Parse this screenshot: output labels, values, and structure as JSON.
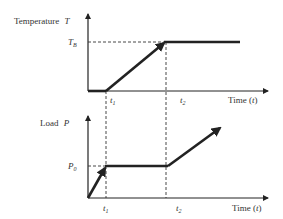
{
  "top_chart": {
    "y_label": "Temperature",
    "y_symbol": "T",
    "level_label": "T",
    "level_sub": "B",
    "t1_label": "t",
    "t1_sub": "1",
    "t2_label": "t",
    "t2_sub": "2",
    "x_label": "Time (",
    "x_symbol": "t",
    "x_close": ")"
  },
  "bottom_chart": {
    "y_label": "Load",
    "y_symbol": "P",
    "level_label": "P",
    "level_sub": "0",
    "t1_label": "t",
    "t1_sub": "1",
    "t2_label": "t",
    "t2_sub": "2",
    "x_label": "Time (",
    "x_symbol": "t",
    "x_close": ")"
  },
  "colors": {
    "line": "#222222",
    "axis": "#222222",
    "dash": "#333333"
  }
}
